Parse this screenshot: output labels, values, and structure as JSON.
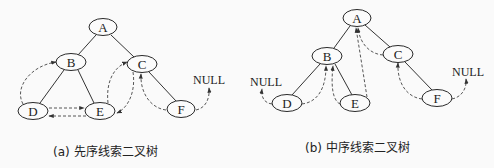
{
  "diagrams": [
    {
      "id": "a",
      "caption": "(a) 先序线索二叉树",
      "nodes": {
        "A": {
          "label": "A",
          "x": 103,
          "y": 27
        },
        "B": {
          "label": "B",
          "x": 71,
          "y": 62
        },
        "C": {
          "label": "C",
          "x": 142,
          "y": 64
        },
        "D": {
          "label": "D",
          "x": 33,
          "y": 111
        },
        "E": {
          "label": "E",
          "x": 100,
          "y": 111
        },
        "F": {
          "label": "F",
          "x": 181,
          "y": 109
        }
      },
      "edges": [
        [
          "A",
          "B"
        ],
        [
          "A",
          "C"
        ],
        [
          "B",
          "D"
        ],
        [
          "B",
          "E"
        ],
        [
          "C",
          "F"
        ]
      ],
      "threads": [
        {
          "from": "D",
          "to": "B"
        },
        {
          "from": "D",
          "to": "E"
        },
        {
          "from": "E",
          "to": "D"
        },
        {
          "from": "E",
          "to": "C"
        },
        {
          "from": "C",
          "to": "E"
        },
        {
          "from": "F",
          "to": "C"
        },
        {
          "from": "F",
          "to": "NULL"
        }
      ],
      "null_labels": [
        {
          "text": "NULL",
          "x": 193,
          "y": 84
        }
      ]
    },
    {
      "id": "b",
      "caption": "(b) 中序线索二叉树",
      "nodes": {
        "A": {
          "label": "A",
          "x": 357,
          "y": 18
        },
        "B": {
          "label": "B",
          "x": 327,
          "y": 56
        },
        "C": {
          "label": "C",
          "x": 398,
          "y": 54
        },
        "D": {
          "label": "D",
          "x": 287,
          "y": 103
        },
        "E": {
          "label": "E",
          "x": 355,
          "y": 103
        },
        "F": {
          "label": "F",
          "x": 437,
          "y": 98
        }
      },
      "edges": [
        [
          "A",
          "B"
        ],
        [
          "A",
          "C"
        ],
        [
          "B",
          "D"
        ],
        [
          "B",
          "E"
        ],
        [
          "C",
          "F"
        ]
      ],
      "threads": [
        {
          "from": "D",
          "to": "NULL"
        },
        {
          "from": "D",
          "to": "B"
        },
        {
          "from": "E",
          "to": "B"
        },
        {
          "from": "E",
          "to": "A"
        },
        {
          "from": "C",
          "to": "A"
        },
        {
          "from": "F",
          "to": "C"
        },
        {
          "from": "F",
          "to": "NULL"
        }
      ],
      "null_labels": [
        {
          "text": "NULL",
          "x": 250,
          "y": 86
        },
        {
          "text": "NULL",
          "x": 452,
          "y": 76
        }
      ]
    }
  ]
}
